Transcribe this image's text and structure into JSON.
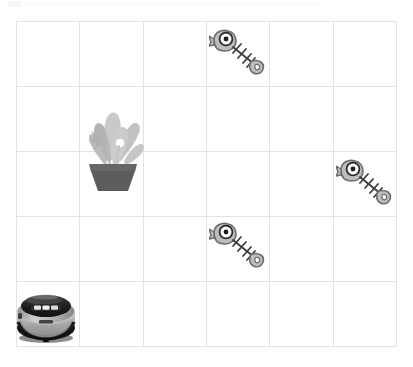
{
  "app": {
    "title": "Robot Vacuum Cleaning Grid",
    "background_color": "#ffffff"
  },
  "grid": {
    "name": "floor-grid",
    "columns": 6,
    "rows": 5,
    "line_color": "#e3e3e5",
    "x": 16,
    "y": 21,
    "width": 381,
    "height": 326,
    "cell_width": 63.5,
    "cell_height": 65.2
  },
  "palette": {
    "grid_line": "#e3e3e5",
    "bone_outline": "#4a4a4a",
    "bone_body": "#b6b6b6",
    "bone_fill": "#d8d8d8",
    "eye_white": "#ffffff",
    "eye_pupil": "#1c1c1c",
    "leaf_light": "#c4c4c4",
    "leaf_mid": "#adadad",
    "leaf_dark": "#9a9a9a",
    "pot_dark": "#5e5e5e",
    "pot_rim": "#6b6b6b",
    "robot_top": "#1e1e1e",
    "robot_body": "#9e9e9e",
    "robot_body_light": "#c8c8c8",
    "robot_shadow": "#111111"
  },
  "entities": [
    {
      "id": "robot-vacuum",
      "name": "robot-vacuum",
      "label": "Robot Vacuum",
      "icon": "robot-vacuum-icon",
      "cell": {
        "col": 1,
        "row": 5
      },
      "x": 14,
      "y": 288,
      "width": 64,
      "height": 56
    },
    {
      "id": "plant-1",
      "name": "potted-plant",
      "label": "Potted Plant",
      "icon": "potted-plant-icon",
      "cell": {
        "col": 2,
        "row": 2
      },
      "x": 80,
      "y": 98,
      "width": 66,
      "height": 94
    },
    {
      "id": "fishbone-1",
      "name": "fishbone-dirt",
      "label": "Fish Bone",
      "icon": "fishbone-icon",
      "cell": {
        "col": 4,
        "row": 1
      },
      "x": 209,
      "y": 27,
      "width": 56,
      "height": 52
    },
    {
      "id": "fishbone-2",
      "name": "fishbone-dirt",
      "label": "Fish Bone",
      "icon": "fishbone-icon",
      "cell": {
        "col": 6,
        "row": 3
      },
      "x": 336,
      "y": 157,
      "width": 56,
      "height": 52
    },
    {
      "id": "fishbone-3",
      "name": "fishbone-dirt",
      "label": "Fish Bone",
      "icon": "fishbone-icon",
      "cell": {
        "col": 4,
        "row": 4
      },
      "x": 209,
      "y": 220,
      "width": 56,
      "height": 52
    }
  ],
  "counts": {
    "fishbones": 3,
    "plants": 1,
    "robots": 1,
    "cells_total": 30
  }
}
